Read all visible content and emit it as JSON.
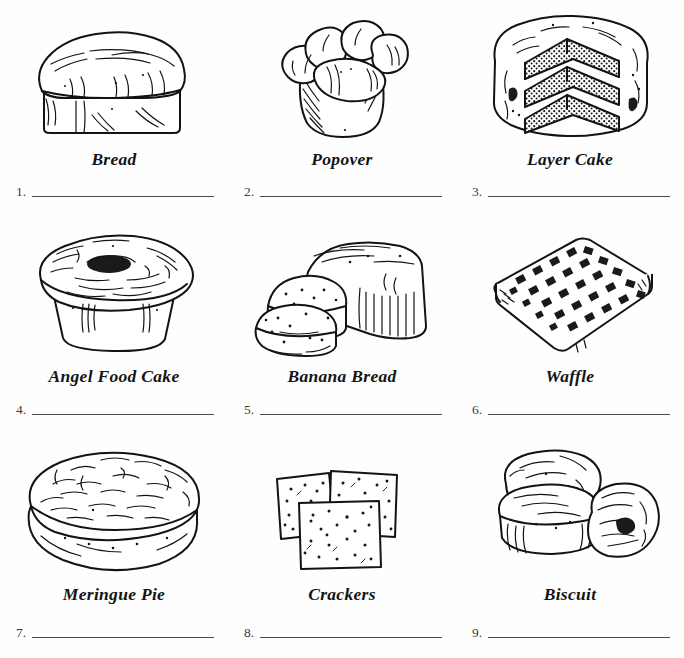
{
  "worksheet": {
    "title": "Baked Goods Picture Word List",
    "background_color": "#fefefe",
    "ink_color": "#131313",
    "rule_color": "#4a4a4a",
    "columns": 3,
    "rows": 3
  },
  "items": [
    {
      "number": "1.",
      "label": "Bread",
      "icon": "bread-loaf-illustration",
      "answer_value": "",
      "answer_placeholder": ""
    },
    {
      "number": "2.",
      "label": "Popover",
      "icon": "popover-illustration",
      "answer_value": "",
      "answer_placeholder": ""
    },
    {
      "number": "3.",
      "label": "Layer Cake",
      "icon": "layer-cake-illustration",
      "answer_value": "",
      "answer_placeholder": ""
    },
    {
      "number": "4.",
      "label": "Angel Food Cake",
      "icon": "angel-food-cake-illustration",
      "answer_value": "",
      "answer_placeholder": ""
    },
    {
      "number": "5.",
      "label": "Banana Bread",
      "icon": "banana-bread-illustration",
      "answer_value": "",
      "answer_placeholder": ""
    },
    {
      "number": "6.",
      "label": "Waffle",
      "icon": "waffle-illustration",
      "answer_value": "",
      "answer_placeholder": ""
    },
    {
      "number": "7.",
      "label": "Meringue Pie",
      "icon": "meringue-pie-illustration",
      "answer_value": "",
      "answer_placeholder": ""
    },
    {
      "number": "8.",
      "label": "Crackers",
      "icon": "crackers-illustration",
      "answer_value": "",
      "answer_placeholder": ""
    },
    {
      "number": "9.",
      "label": "Biscuit",
      "icon": "biscuit-illustration",
      "answer_value": "",
      "answer_placeholder": ""
    }
  ]
}
